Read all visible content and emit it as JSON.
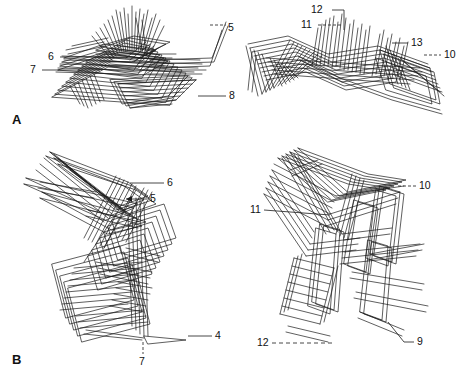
{
  "figure": {
    "background_color": "#ffffff",
    "line_color": "#1a1a1a",
    "width": 467,
    "height": 381,
    "type": "superimposed-wireframe-outline-plot"
  },
  "panels": [
    {
      "letter": "A",
      "letter_x": 12,
      "letter_y": 112,
      "plots": [
        {
          "name": "panel-a-left",
          "callouts": [
            {
              "label": "5",
              "x": 228,
              "y": 22,
              "leader": "dashed-horizontal"
            },
            {
              "label": "6",
              "x": 48,
              "y": 54,
              "leader": "solid-horizontal"
            },
            {
              "label": "7",
              "x": 30,
              "y": 67,
              "leader": "solid-horizontal"
            },
            {
              "label": "8",
              "x": 186,
              "y": 93,
              "leader": "solid-horizontal"
            }
          ]
        },
        {
          "name": "panel-a-right",
          "callouts": [
            {
              "label": "12",
              "x": 311,
              "y": 5,
              "leader": "solid-elbow"
            },
            {
              "label": "11",
              "x": 301,
              "y": 22,
              "leader": "dashed-horizontal"
            },
            {
              "label": "13",
              "x": 410,
              "y": 40,
              "leader": "solid-horizontal"
            },
            {
              "label": "10",
              "x": 443,
              "y": 52,
              "leader": "dashed-horizontal"
            }
          ]
        }
      ]
    },
    {
      "letter": "B",
      "letter_x": 12,
      "letter_y": 352,
      "plots": [
        {
          "name": "panel-b-left",
          "callouts": [
            {
              "label": "6",
              "x": 166,
              "y": 180,
              "leader": "solid-horizontal"
            },
            {
              "label": "5",
              "x": 149,
              "y": 196,
              "leader": "solid-horizontal-arrow"
            },
            {
              "label": "4",
              "x": 214,
              "y": 333,
              "leader": "solid-horizontal"
            },
            {
              "label": "7",
              "x": 136,
              "y": 356,
              "leader": "dashed-vertical"
            }
          ]
        },
        {
          "name": "panel-b-right",
          "callouts": [
            {
              "label": "10",
              "x": 418,
              "y": 183,
              "leader": "dashed-horizontal"
            },
            {
              "label": "11",
              "x": 251,
              "y": 207,
              "leader": "solid-horizontal"
            },
            {
              "label": "12",
              "x": 259,
              "y": 340,
              "leader": "dashed-horizontal"
            },
            {
              "label": "9",
              "x": 416,
              "y": 339,
              "leader": "solid-elbow"
            }
          ]
        }
      ]
    }
  ]
}
